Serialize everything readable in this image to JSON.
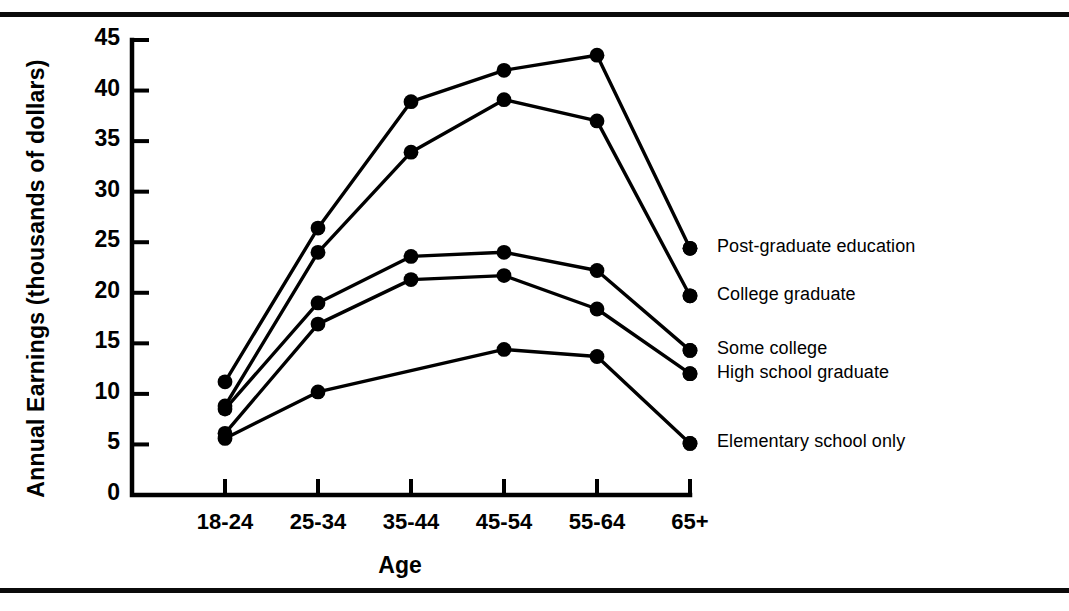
{
  "chart_data": {
    "type": "line",
    "title": "",
    "xlabel": "Age",
    "ylabel": "Annual Earnings (thousands of dollars)",
    "categories": [
      "18-24",
      "25-34",
      "35-44",
      "45-54",
      "55-64",
      "65+"
    ],
    "ylim": [
      0,
      45
    ],
    "yticks": [
      0,
      5,
      10,
      15,
      20,
      25,
      30,
      35,
      40,
      45
    ],
    "ytick_labels": [
      "0",
      "5",
      "10",
      "15",
      "20",
      "25",
      "30",
      "35",
      "40",
      "45"
    ],
    "grid": false,
    "legend_position": "right-inline-labels",
    "marker": "filled-circle",
    "line_color": "#000000",
    "series": [
      {
        "name": "Post-graduate education",
        "values": [
          11.2,
          26.4,
          38.9,
          42.0,
          43.5,
          24.4
        ]
      },
      {
        "name": "College graduate",
        "values": [
          8.8,
          24.0,
          33.9,
          39.1,
          37.0,
          19.7
        ]
      },
      {
        "name": "Some college",
        "values": [
          8.5,
          19.0,
          23.6,
          24.0,
          22.2,
          14.3
        ]
      },
      {
        "name": "High school graduate",
        "values": [
          6.1,
          16.9,
          21.3,
          21.7,
          18.4,
          12.0
        ]
      },
      {
        "name": "Elementary school only",
        "values": [
          5.6,
          10.2,
          null,
          14.4,
          13.7,
          5.1
        ]
      }
    ]
  }
}
